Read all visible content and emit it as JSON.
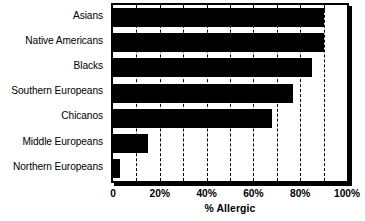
{
  "chart_data": {
    "type": "bar",
    "orientation": "horizontal",
    "title": "",
    "xlabel": "% Allergic",
    "ylabel": "",
    "categories": [
      "Asians",
      "Native Americans",
      "Blacks",
      "Southern Europeans",
      "Chicanos",
      "Middle Europeans",
      "Northern Europeans"
    ],
    "values": [
      90,
      90,
      85,
      77,
      68,
      15,
      3
    ],
    "value_unit": "%",
    "xlim": [
      0,
      100
    ],
    "xticks": [
      0,
      20,
      40,
      60,
      80,
      100
    ],
    "xtick_labels": [
      "0",
      "20%",
      "40%",
      "60%",
      "80%",
      "100%"
    ],
    "gridlines": [
      10,
      20,
      30,
      40,
      50,
      60,
      70,
      80,
      90
    ],
    "grid": true,
    "grid_style": "dashed-vertical",
    "legend": "none",
    "bar_color": "#000000",
    "background_color": "#ffffff",
    "frame_color": "#000000"
  }
}
